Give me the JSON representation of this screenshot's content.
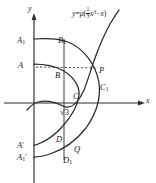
{
  "figure": {
    "background_color": "#ffffff",
    "ink_color": "#1a1a1a",
    "equation": {
      "lhs": "y",
      "equals": "=",
      "mu": "μ",
      "open_paren": "(",
      "frac_num": "1",
      "frac_den": "3",
      "x_cubed_base": "x",
      "x_cubed_exp": "3",
      "minus": "−",
      "x_term": "x",
      "close_paren": ")",
      "plain": "y = μ(⅓x³ − x)"
    },
    "axes": {
      "x_label": "x",
      "y_label": "y",
      "origin_x": 34,
      "origin_y": 103
    },
    "labels": [
      {
        "id": "A1",
        "base": "A",
        "sub": "1",
        "prime": "",
        "x": 17,
        "y": 36,
        "anchor_x": 34,
        "anchor_y": 39
      },
      {
        "id": "B1",
        "base": "B",
        "sub": "1",
        "prime": "",
        "x": 58,
        "y": 36,
        "anchor_x": 64,
        "anchor_y": 39
      },
      {
        "id": "A",
        "base": "A",
        "sub": "",
        "prime": "",
        "x": 18,
        "y": 61,
        "anchor_x": 34,
        "anchor_y": 64
      },
      {
        "id": "B",
        "base": "B",
        "sub": "",
        "prime": "",
        "x": 55,
        "y": 71,
        "anchor_x": 64,
        "anchor_y": 69
      },
      {
        "id": "P",
        "base": "P",
        "sub": "",
        "prime": "",
        "x": 99,
        "y": 66,
        "anchor_x": 98,
        "anchor_y": 69
      },
      {
        "id": "C1",
        "base": "C",
        "sub": "1",
        "prime": "",
        "x": 100,
        "y": 83,
        "anchor_x": 99,
        "anchor_y": 85
      },
      {
        "id": "C",
        "base": "C",
        "sub": "",
        "prime": "",
        "x": 73,
        "y": 92,
        "anchor_x": 78,
        "anchor_y": 92
      },
      {
        "id": "sqrt3",
        "base": "√3",
        "sub": "",
        "prime": "",
        "x": 60,
        "y": 108,
        "anchor_x": 64,
        "anchor_y": 103
      },
      {
        "id": "D",
        "base": "D",
        "sub": "",
        "prime": "",
        "x": 56,
        "y": 135,
        "anchor_x": 64,
        "anchor_y": 137
      },
      {
        "id": "Q",
        "base": "Q",
        "sub": "",
        "prime": "",
        "x": 74,
        "y": 145,
        "anchor_x": 74,
        "anchor_y": 143
      },
      {
        "id": "D1",
        "base": "D",
        "sub": "1",
        "prime": "",
        "x": 63,
        "y": 156,
        "anchor_x": 64,
        "anchor_y": 153
      },
      {
        "id": "Aprime",
        "base": "A",
        "sub": "",
        "prime": "'",
        "x": 17,
        "y": 141,
        "anchor_x": 34,
        "anchor_y": 145
      },
      {
        "id": "A1prime",
        "base": "A",
        "sub": "1",
        "prime": "'",
        "x": 17,
        "y": 153,
        "anchor_x": 34,
        "anchor_y": 157
      }
    ],
    "curves": [
      {
        "id": "cubic-curve",
        "name": "y = μ(⅓x³ − x)",
        "style": "solid"
      },
      {
        "id": "outer-arc",
        "name": "outer arc A1-B1-C1-D1",
        "style": "solid"
      },
      {
        "id": "inner-arc",
        "name": "inner arc A-B-C-D",
        "style": "solid"
      },
      {
        "id": "chord-A-P",
        "name": "dashed horizontal A to P",
        "style": "dashed"
      },
      {
        "id": "vertical-sqrt3",
        "name": "vertical line at x = √3",
        "style": "solid"
      }
    ]
  }
}
